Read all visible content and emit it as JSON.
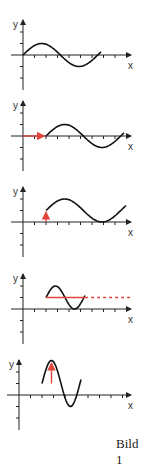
{
  "caption": "Bild 1",
  "axis_labels": {
    "x": "x",
    "y": "y"
  },
  "colors": {
    "curve": "#111111",
    "highlight": "#e0443a"
  },
  "chart_data": [
    {
      "type": "line",
      "title": "Panel 1",
      "description": "y = sin(x), one period starting at origin",
      "shift_x": 0,
      "shift_y": 0,
      "amplitude": 1,
      "period_units": 6.5,
      "start_x": 0
    },
    {
      "type": "line",
      "title": "Panel 2",
      "description": "sine shifted right (red horizontal arrow)",
      "shift_x": 2,
      "shift_y": 0,
      "amplitude": 1,
      "period_units": 6.5,
      "start_x": 2,
      "annotation": "horizontal shift arrow"
    },
    {
      "type": "line",
      "title": "Panel 3",
      "description": "sine shifted right and up (red vertical arrow)",
      "shift_x": 2,
      "shift_y": 1,
      "amplitude": 1,
      "period_units": 6.5,
      "start_x": 2,
      "annotation": "vertical shift arrow"
    },
    {
      "type": "line",
      "title": "Panel 4",
      "description": "shifted sine with compressed period, red midline (dashed continuation)",
      "shift_x": 2,
      "shift_y": 1,
      "amplitude": 1,
      "period_units": 3.3,
      "start_x": 2,
      "annotation": "midline"
    },
    {
      "type": "line",
      "title": "Panel 5",
      "description": "shifted compressed sine with larger amplitude (red amplitude arrow)",
      "shift_x": 2,
      "shift_y": 1,
      "amplitude": 2,
      "period_units": 3.3,
      "start_x": 2,
      "annotation": "amplitude arrow"
    }
  ]
}
